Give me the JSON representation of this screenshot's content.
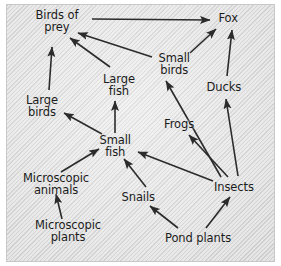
{
  "diagram": {
    "type": "food-web",
    "background_color": "#dedede",
    "text_color": "#1b1b1b",
    "arrow_color": "#2b2b2b",
    "nodes": [
      {
        "id": "birds_of_prey",
        "label": "Birds of\nprey",
        "x": 57,
        "y": 21
      },
      {
        "id": "fox",
        "label": "Fox",
        "x": 228,
        "y": 18
      },
      {
        "id": "small_birds",
        "label": "Small\nbirds",
        "x": 174,
        "y": 64
      },
      {
        "id": "large_fish",
        "label": "Large\nfish",
        "x": 119,
        "y": 85
      },
      {
        "id": "ducks",
        "label": "Ducks",
        "x": 224,
        "y": 87
      },
      {
        "id": "large_birds",
        "label": "Large\nbirds",
        "x": 42,
        "y": 106
      },
      {
        "id": "frogs",
        "label": "Frogs",
        "x": 179,
        "y": 124
      },
      {
        "id": "small_fish",
        "label": "Small\nfish",
        "x": 115,
        "y": 146
      },
      {
        "id": "insects",
        "label": "Insects",
        "x": 234,
        "y": 187
      },
      {
        "id": "microscopic_animals",
        "label": "Microscopic\nanimals",
        "x": 56,
        "y": 184
      },
      {
        "id": "snails",
        "label": "Snails",
        "x": 138,
        "y": 197
      },
      {
        "id": "microscopic_plants",
        "label": "Microscopic\nplants",
        "x": 68,
        "y": 231
      },
      {
        "id": "pond_plants",
        "label": "Pond plants",
        "x": 198,
        "y": 238
      }
    ],
    "edges": [
      {
        "from": "birds_of_prey",
        "to": "fox",
        "x1": 92,
        "y1": 19,
        "x2": 210,
        "y2": 20
      },
      {
        "from": "small_birds",
        "to": "birds_of_prey",
        "x1": 152,
        "y1": 57,
        "x2": 78,
        "y2": 33
      },
      {
        "from": "large_fish",
        "to": "birds_of_prey",
        "x1": 110,
        "y1": 67,
        "x2": 70,
        "y2": 38
      },
      {
        "from": "large_birds",
        "to": "birds_of_prey",
        "x1": 49,
        "y1": 90,
        "x2": 52,
        "y2": 47
      },
      {
        "from": "small_birds",
        "to": "fox",
        "x1": 190,
        "y1": 53,
        "x2": 216,
        "y2": 29
      },
      {
        "from": "ducks",
        "to": "fox",
        "x1": 227,
        "y1": 76,
        "x2": 232,
        "y2": 30
      },
      {
        "from": "insects",
        "to": "small_birds",
        "x1": 221,
        "y1": 177,
        "x2": 166,
        "y2": 81
      },
      {
        "from": "insects",
        "to": "ducks",
        "x1": 238,
        "y1": 176,
        "x2": 226,
        "y2": 99
      },
      {
        "from": "insects",
        "to": "frogs",
        "x1": 228,
        "y1": 177,
        "x2": 189,
        "y2": 135
      },
      {
        "from": "insects",
        "to": "small_fish",
        "x1": 213,
        "y1": 181,
        "x2": 138,
        "y2": 152
      },
      {
        "from": "small_fish",
        "to": "large_fish",
        "x1": 115,
        "y1": 133,
        "x2": 115,
        "y2": 101
      },
      {
        "from": "small_fish",
        "to": "large_birds",
        "x1": 102,
        "y1": 134,
        "x2": 64,
        "y2": 113
      },
      {
        "from": "microscopic_animals",
        "to": "small_fish",
        "x1": 61,
        "y1": 172,
        "x2": 99,
        "y2": 149
      },
      {
        "from": "microscopic_plants",
        "to": "microscopic_animals",
        "x1": 62,
        "y1": 219,
        "x2": 56,
        "y2": 194
      },
      {
        "from": "snails",
        "to": "small_fish",
        "x1": 146,
        "y1": 187,
        "x2": 124,
        "y2": 159
      },
      {
        "from": "pond_plants",
        "to": "snails",
        "x1": 178,
        "y1": 228,
        "x2": 150,
        "y2": 206
      },
      {
        "from": "pond_plants",
        "to": "insects",
        "x1": 206,
        "y1": 228,
        "x2": 230,
        "y2": 197
      }
    ]
  }
}
